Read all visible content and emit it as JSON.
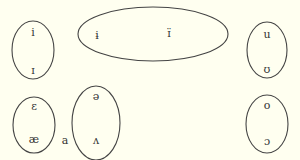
{
  "background": "#fffff0",
  "stroke_color": "#444444",
  "groups": [
    {
      "name": "high-front",
      "ellipse": {
        "cx": 33,
        "cy": 50,
        "rx": 21,
        "ry": 29
      },
      "vowels": [
        {
          "symbol": "i",
          "x": 33,
          "y": 33
        },
        {
          "symbol": "ɪ",
          "x": 33,
          "y": 71
        }
      ]
    },
    {
      "name": "high-central",
      "ellipse": {
        "cx": 153,
        "cy": 34,
        "rx": 75,
        "ry": 27
      },
      "vowels": [
        {
          "symbol": "ɨ",
          "x": 97,
          "y": 36
        },
        {
          "symbol": "ɪ̈",
          "x": 169,
          "y": 34
        }
      ]
    },
    {
      "name": "high-back",
      "ellipse": {
        "cx": 267,
        "cy": 50,
        "rx": 20,
        "ry": 28
      },
      "vowels": [
        {
          "symbol": "u",
          "x": 267,
          "y": 35
        },
        {
          "symbol": "ʊ",
          "x": 267,
          "y": 70
        }
      ]
    },
    {
      "name": "low-front",
      "ellipse": {
        "cx": 34,
        "cy": 125,
        "rx": 21,
        "ry": 28
      },
      "vowels": [
        {
          "symbol": "ɛ",
          "x": 34,
          "y": 107
        },
        {
          "symbol": "æ",
          "x": 34,
          "y": 140
        }
      ]
    },
    {
      "name": "mid-central",
      "ellipse": {
        "cx": 96,
        "cy": 123,
        "rx": 24,
        "ry": 37
      },
      "vowels": [
        {
          "symbol": "ə",
          "x": 96,
          "y": 97
        },
        {
          "symbol": "ʌ",
          "x": 96,
          "y": 141
        }
      ]
    },
    {
      "name": "mid-back",
      "ellipse": {
        "cx": 267,
        "cy": 124,
        "rx": 21,
        "ry": 29
      },
      "vowels": [
        {
          "symbol": "o",
          "x": 267,
          "y": 106
        },
        {
          "symbol": "ɔ",
          "x": 267,
          "y": 142
        }
      ]
    }
  ],
  "standalone": [
    {
      "symbol": "a",
      "x": 65,
      "y": 141
    }
  ]
}
